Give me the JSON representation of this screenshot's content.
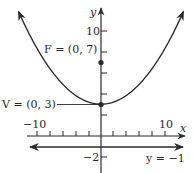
{
  "diagram": {
    "type": "parabola",
    "equation_implied": "x^2 = 16(y - 3)",
    "axes": {
      "x_label": "x",
      "y_label": "y",
      "x_tick_labels": {
        "left": "−10",
        "right": "10"
      },
      "y_tick_labels": {
        "top": "10",
        "bottom": "−2"
      },
      "x_tick_step": 2,
      "y_tick_step": 2
    },
    "focus": {
      "label": "F = (0, 7)",
      "x": 0,
      "y": 7
    },
    "vertex": {
      "label": "V = (0, 3)",
      "x": 0,
      "y": 3
    },
    "directrix": {
      "label": "y = −1",
      "y": -1
    },
    "colors": {
      "ink": "#2a2a2a",
      "background": "#ffffff"
    }
  }
}
